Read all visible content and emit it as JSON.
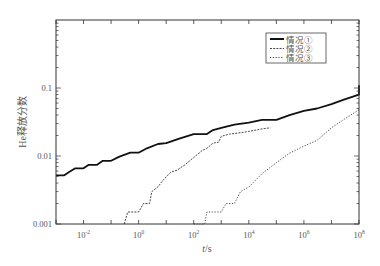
{
  "chart_data": {
    "type": "line",
    "title": "",
    "xlabel": "t/s",
    "ylabel": "He释放分数",
    "xscale": "log",
    "yscale": "log",
    "xlim": [
      0.001,
      100000000
    ],
    "ylim": [
      0.001,
      1
    ],
    "xticks": [
      {
        "value": 0.01,
        "label_base": "10",
        "label_exp": "-2"
      },
      {
        "value": 1,
        "label_base": "10",
        "label_exp": "0"
      },
      {
        "value": 100,
        "label_base": "10",
        "label_exp": "2"
      },
      {
        "value": 10000,
        "label_base": "10",
        "label_exp": "4"
      },
      {
        "value": 1000000,
        "label_base": "10",
        "label_exp": "6"
      },
      {
        "value": 100000000,
        "label_base": "10",
        "label_exp": "8"
      }
    ],
    "yticks": [
      {
        "value": 0.001,
        "label": "0.001"
      },
      {
        "value": 0.01,
        "label": "0.01"
      },
      {
        "value": 0.1,
        "label": "0.1"
      }
    ],
    "grid": false,
    "legend_position": "upper right",
    "series": [
      {
        "name": "情况①",
        "style": "solid",
        "points": [
          [
            0.001,
            0.0052
          ],
          [
            0.002,
            0.0052
          ],
          [
            0.003,
            0.0058
          ],
          [
            0.005,
            0.0066
          ],
          [
            0.01,
            0.0066
          ],
          [
            0.015,
            0.0074
          ],
          [
            0.03,
            0.0074
          ],
          [
            0.05,
            0.0085
          ],
          [
            0.1,
            0.0085
          ],
          [
            0.2,
            0.0098
          ],
          [
            0.5,
            0.0112
          ],
          [
            1,
            0.0112
          ],
          [
            2,
            0.013
          ],
          [
            5,
            0.015
          ],
          [
            10,
            0.0155
          ],
          [
            30,
            0.018
          ],
          [
            100,
            0.021
          ],
          [
            300,
            0.021
          ],
          [
            500,
            0.024
          ],
          [
            1000,
            0.026
          ],
          [
            3000,
            0.029
          ],
          [
            10000,
            0.031
          ],
          [
            30000,
            0.034
          ],
          [
            100000,
            0.034
          ],
          [
            300000,
            0.04
          ],
          [
            1000000,
            0.046
          ],
          [
            3000000,
            0.05
          ],
          [
            10000000,
            0.058
          ],
          [
            30000000,
            0.068
          ],
          [
            100000000,
            0.08
          ],
          [
            300000000,
            0.092
          ],
          [
            1000000000,
            0.1
          ],
          [
            3000000000,
            0.102
          ],
          [
            10000000000,
            0.106
          ],
          [
            30000000000,
            0.108
          ],
          [
            100000000000,
            0.11
          ]
        ]
      },
      {
        "name": "情况②",
        "style": "dashed",
        "points": [
          [
            0.3,
            0.001
          ],
          [
            0.4,
            0.0015
          ],
          [
            1,
            0.0015
          ],
          [
            1.5,
            0.002
          ],
          [
            2.5,
            0.002
          ],
          [
            3,
            0.003
          ],
          [
            5,
            0.0035
          ],
          [
            8,
            0.0045
          ],
          [
            15,
            0.0058
          ],
          [
            25,
            0.0062
          ],
          [
            50,
            0.0075
          ],
          [
            100,
            0.0095
          ],
          [
            200,
            0.012
          ],
          [
            300,
            0.013
          ],
          [
            500,
            0.0155
          ],
          [
            800,
            0.016
          ],
          [
            1000,
            0.0195
          ],
          [
            2000,
            0.021
          ],
          [
            5000,
            0.022
          ],
          [
            10000,
            0.023
          ],
          [
            30000,
            0.025
          ],
          [
            60000,
            0.026
          ]
        ]
      },
      {
        "name": "情况③",
        "style": "dotted",
        "points": [
          [
            100,
            0.001
          ],
          [
            200,
            0.001
          ],
          [
            250,
            0.001
          ],
          [
            300,
            0.0015
          ],
          [
            1000,
            0.0015
          ],
          [
            1500,
            0.002
          ],
          [
            3000,
            0.002
          ],
          [
            5000,
            0.003
          ],
          [
            10000,
            0.0035
          ],
          [
            30000,
            0.0055
          ],
          [
            100000,
            0.008
          ],
          [
            300000,
            0.011
          ],
          [
            1000000,
            0.014
          ],
          [
            3000000,
            0.017
          ],
          [
            10000000,
            0.026
          ],
          [
            30000000,
            0.035
          ],
          [
            100000000,
            0.048
          ]
        ]
      }
    ]
  },
  "legend": {
    "items": [
      {
        "label": "情况①",
        "style": "solid"
      },
      {
        "label": "情况②",
        "style": "dashed"
      },
      {
        "label": "情况③",
        "style": "dotted"
      }
    ]
  },
  "axes": {
    "xlabel_italic": "t",
    "xlabel_unit": "/s",
    "ylabel": "He释放分数"
  }
}
